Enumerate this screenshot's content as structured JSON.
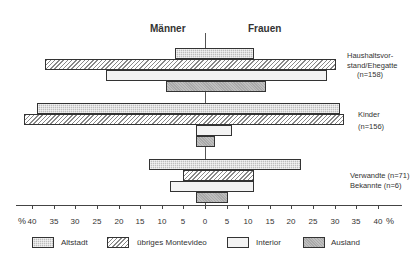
{
  "chart_data": {
    "type": "bar",
    "orientation": "horizontal-diverging",
    "title": "",
    "left_side_label": "Männer",
    "right_side_label": "Frauen",
    "xlabel": "%",
    "xlim": [
      -40,
      40
    ],
    "x_ticks": [
      "40",
      "35",
      "30",
      "25",
      "20",
      "15",
      "10",
      "5",
      "0",
      "5",
      "10",
      "15",
      "20",
      "25",
      "30",
      "35",
      "40"
    ],
    "unit_left": "%",
    "unit_right": "%",
    "grid": false,
    "legend_position": "bottom",
    "categories": [
      {
        "label_lines": [
          "Haushaltsvor-",
          "stand/Ehegatte",
          "(n=158)"
        ]
      },
      {
        "label_lines": [
          "Kinder",
          "(n=156)"
        ]
      },
      {
        "label_lines": [
          "Verwandte (n=71)",
          "Bekannte (n=6)"
        ]
      }
    ],
    "series": [
      {
        "name": "Altstadt",
        "maenner": [
          7,
          39,
          13
        ],
        "frauen": [
          11,
          31,
          22
        ]
      },
      {
        "name": "übriges Montevideo",
        "maenner": [
          37,
          42,
          5
        ],
        "frauen": [
          30,
          32,
          11
        ]
      },
      {
        "name": "Interior",
        "maenner": [
          23,
          2,
          8
        ],
        "frauen": [
          28,
          6,
          11
        ]
      },
      {
        "name": "Ausland",
        "maenner": [
          9,
          2,
          2
        ],
        "frauen": [
          14,
          2,
          5
        ]
      }
    ]
  },
  "headers": {
    "left": "Männer",
    "right": "Frauen"
  },
  "axis": {
    "percent_left": "%",
    "percent_right": "%",
    "ticks": [
      "40",
      "35",
      "30",
      "25",
      "20",
      "15",
      "10",
      "5",
      "0",
      "5",
      "10",
      "15",
      "20",
      "25",
      "30",
      "35",
      "40"
    ]
  },
  "labels": {
    "haushalt_1": "Haushaltsvor-",
    "haushalt_2": "stand/Ehegatte",
    "haushalt_3": "(n=158)",
    "kinder_1": "Kinder",
    "kinder_2": "(n=156)",
    "verwandte": "Verwandte (n=71)",
    "bekannte": "Bekannte (n=6)"
  },
  "legend": {
    "altstadt": "Altstadt",
    "montevideo": "übriges Montevideo",
    "interior": "Interior",
    "ausland": "Ausland"
  }
}
